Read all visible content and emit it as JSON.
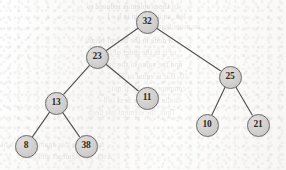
{
  "diagram": {
    "type": "binary-search-tree",
    "node_radius": 11.5,
    "edge_color": "#54524f",
    "node_fill": "#d2d0ce",
    "node_stroke": "#6f6d6b",
    "label_color": "#2b2a29",
    "background_color": "#fbfbfa",
    "nodes": [
      {
        "id": "n32",
        "label": "32",
        "x": 147,
        "y": 22,
        "depth": 0,
        "role": "root"
      },
      {
        "id": "n23",
        "label": "23",
        "x": 97,
        "y": 57,
        "depth": 1,
        "role": "left-child"
      },
      {
        "id": "n25",
        "label": "25",
        "x": 230,
        "y": 77,
        "depth": 1,
        "role": "right-child"
      },
      {
        "id": "n13",
        "label": "13",
        "x": 56,
        "y": 103,
        "depth": 2,
        "role": "left-child"
      },
      {
        "id": "n11",
        "label": "11",
        "x": 147,
        "y": 98,
        "depth": 2,
        "role": "right-child"
      },
      {
        "id": "n10",
        "label": "10",
        "x": 207,
        "y": 125,
        "depth": 2,
        "role": "left-child"
      },
      {
        "id": "n21",
        "label": "21",
        "x": 258,
        "y": 125,
        "depth": 2,
        "role": "right-child"
      },
      {
        "id": "n8",
        "label": "8",
        "x": 26,
        "y": 146,
        "depth": 3,
        "role": "left-child"
      },
      {
        "id": "n38",
        "label": "38",
        "x": 86,
        "y": 146,
        "depth": 3,
        "role": "right-child"
      }
    ],
    "edges": [
      {
        "id": "e32-23",
        "from": "n32",
        "to": "n23",
        "side": "left"
      },
      {
        "id": "e32-25",
        "from": "n32",
        "to": "n25",
        "side": "right"
      },
      {
        "id": "e23-13",
        "from": "n23",
        "to": "n13",
        "side": "left"
      },
      {
        "id": "e23-11",
        "from": "n23",
        "to": "n11",
        "side": "right"
      },
      {
        "id": "e13-8",
        "from": "n13",
        "to": "n8",
        "side": "left"
      },
      {
        "id": "e13-38",
        "from": "n13",
        "to": "n38",
        "side": "right"
      },
      {
        "id": "e25-10",
        "from": "n25",
        "to": "n10",
        "side": "left"
      },
      {
        "id": "e25-21",
        "from": "n25",
        "to": "n21",
        "side": "right"
      }
    ]
  },
  "background_bleed": {
    "description": "faint mirrored show-through text from the reverse page",
    "lines": [
      {
        "text": "of the problem is reduced to",
        "x": 178,
        "y": 2,
        "size": 7.5,
        "opacity": 0.38
      },
      {
        "text": "left, so its height is h - 1",
        "x": 186,
        "y": 12,
        "size": 7.5,
        "opacity": 0.34
      },
      {
        "text": "no more than",
        "x": 200,
        "y": 22,
        "size": 7.5,
        "opacity": 0.3
      },
      {
        "text": "a node in the tree of height",
        "x": 172,
        "y": 36,
        "size": 7.5,
        "opacity": 0.36
      },
      {
        "text": "of it in the order of the tree",
        "x": 176,
        "y": 48,
        "size": 7.5,
        "opacity": 0.33
      },
      {
        "text": "and the value of the node",
        "x": 182,
        "y": 60,
        "size": 7.5,
        "opacity": 0.31
      },
      {
        "text": "10. If it is equal to 32",
        "x": 188,
        "y": 72,
        "size": 7.5,
        "opacity": 0.33
      },
      {
        "text": "compare it to 23, if not",
        "x": 186,
        "y": 84,
        "size": 7.5,
        "opacity": 0.3
      },
      {
        "text": "in the tree, the next is 8",
        "x": 180,
        "y": 96,
        "size": 7.5,
        "opacity": 0.29
      },
      {
        "text": "Thus, the element has been",
        "x": 176,
        "y": 108,
        "size": 7.5,
        "opacity": 0.28
      },
      {
        "text": "to be sure it is again a search of",
        "x": 104,
        "y": 140,
        "size": 7.5,
        "opacity": 0.3
      },
      {
        "text": "a set, the elements and their",
        "x": 112,
        "y": 152,
        "size": 7.5,
        "opacity": 0.28
      }
    ]
  }
}
